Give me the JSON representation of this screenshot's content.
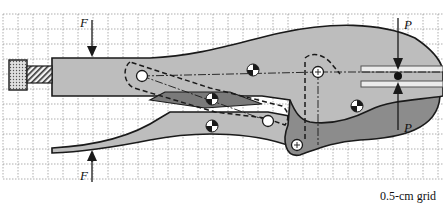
{
  "figure": {
    "caption": "0.5-cm grid",
    "grid": {
      "spacing_px": 15,
      "origin_x": 3,
      "origin_y": 14,
      "color": "#9a9a9a"
    },
    "labels": {
      "force_top": "F",
      "force_bottom": "F",
      "jaw_top": "P",
      "jaw_bottom": "P"
    },
    "colors": {
      "handle_light": "#bdbdbd",
      "jaw_dark": "#8c8c8c",
      "link_dark": "#7a7a7a",
      "outline": "#1a1a1a",
      "knob": "#d9d9d9"
    },
    "components": [
      "adjusting-screw-knob",
      "threaded-screw",
      "upper-handle",
      "lower-handle",
      "toggle-link",
      "lower-jaw",
      "workpiece-jaws"
    ],
    "pins": [
      {
        "name": "pin-a",
        "x": 142,
        "y": 76
      },
      {
        "name": "pin-b",
        "x": 318,
        "y": 72
      },
      {
        "name": "pin-c",
        "x": 268,
        "y": 121
      },
      {
        "name": "pin-d",
        "x": 297,
        "y": 145
      }
    ],
    "centers_of_mass": [
      {
        "name": "com-upper-handle",
        "x": 253,
        "y": 70
      },
      {
        "name": "com-link",
        "x": 212,
        "y": 99
      },
      {
        "name": "com-lower-handle",
        "x": 212,
        "y": 126
      },
      {
        "name": "com-lower-jaw",
        "x": 357,
        "y": 106
      }
    ]
  }
}
